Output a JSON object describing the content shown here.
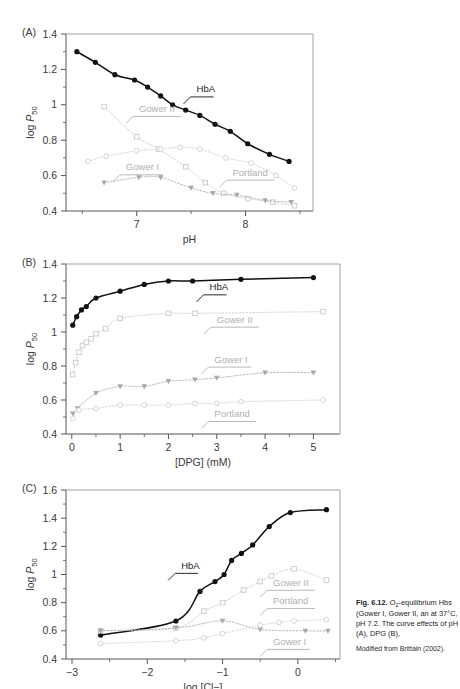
{
  "figure": {
    "number": "Fig. 6.12.",
    "caption_line1": "O",
    "caption_sub": "2",
    "caption_line1b": "-equilibrium",
    "caption_rest": "Hbs (Gower I, Gower II, an at 37°C, pH 7.2. The curve effects of pH (A), DPG (B),",
    "source": "Modified from Brittain (2002)."
  },
  "colors": {
    "hba": "#111111",
    "gower2": "#c9c9c9",
    "gower1": "#a8a8a8",
    "portland": "#cfcfcf",
    "axis": "#555555",
    "text": "#3a3a3a",
    "gray_label": "#b0b0b0"
  },
  "panels": [
    {
      "letter": "(A)",
      "name": "panel-a",
      "chart_data": {
        "type": "scatter",
        "title": "",
        "xlabel": "pH",
        "ylabel": "log P50",
        "xlim": [
          6.35,
          8.62
        ],
        "ylim": [
          0.4,
          1.4
        ],
        "xticks": [
          7,
          8
        ],
        "xminor": [
          6.5,
          7.5,
          8.5
        ],
        "yticks": [
          0.4,
          0.6,
          0.8,
          1.0,
          1.2,
          1.4
        ],
        "yminor": [
          0.5,
          0.7,
          0.9,
          1.1,
          1.3
        ],
        "grid": false,
        "series": [
          {
            "name": "HbA",
            "marker": "filled-circle",
            "color": "#111111",
            "x": [
              6.45,
              6.62,
              6.8,
              6.98,
              7.1,
              7.22,
              7.33,
              7.45,
              7.58,
              7.72,
              7.86,
              8.02,
              8.22,
              8.4
            ],
            "y": [
              1.3,
              1.24,
              1.17,
              1.14,
              1.1,
              1.05,
              1.0,
              0.97,
              0.94,
              0.89,
              0.85,
              0.78,
              0.72,
              0.68
            ]
          },
          {
            "name": "Gower II",
            "marker": "open-square",
            "color": "#c9c9c9",
            "x": [
              6.7,
              7.0,
              7.2,
              7.45,
              7.63,
              7.8,
              8.02,
              8.25,
              8.45
            ],
            "y": [
              0.99,
              0.82,
              0.75,
              0.65,
              0.56,
              0.5,
              0.47,
              0.45,
              0.43
            ]
          },
          {
            "name": "Gower I",
            "marker": "filled-triangle-down",
            "color": "#a8a8a8",
            "x": [
              6.7,
              7.02,
              7.22,
              7.5,
              7.7,
              7.92,
              8.18,
              8.42
            ],
            "y": [
              0.56,
              0.59,
              0.59,
              0.53,
              0.5,
              0.49,
              0.46,
              0.45
            ]
          },
          {
            "name": "Portland",
            "marker": "open-circle",
            "color": "#cfcfcf",
            "x": [
              6.55,
              6.72,
              7.0,
              7.22,
              7.4,
              7.58,
              7.82,
              8.05,
              8.28,
              8.45
            ],
            "y": [
              0.68,
              0.71,
              0.74,
              0.75,
              0.76,
              0.75,
              0.7,
              0.67,
              0.6,
              0.53
            ]
          }
        ],
        "annotations": [
          {
            "text": "HbA",
            "x": 7.55,
            "y": 1.07,
            "style": "dark"
          },
          {
            "text": "Gower II",
            "x": 7.02,
            "y": 0.96,
            "style": "gray"
          },
          {
            "text": "Gower I",
            "x": 6.9,
            "y": 0.63,
            "style": "gray"
          },
          {
            "text": "Portland",
            "x": 7.88,
            "y": 0.6,
            "style": "gray"
          }
        ]
      }
    },
    {
      "letter": "(B)",
      "name": "panel-b",
      "chart_data": {
        "type": "scatter",
        "title": "",
        "xlabel": "[DPG] (mM)",
        "ylabel": "log P50",
        "xlim": [
          -0.12,
          5.55
        ],
        "ylim": [
          0.4,
          1.4
        ],
        "xticks": [
          0,
          1,
          2,
          3,
          4,
          5
        ],
        "xminor": [
          0.5,
          1.5,
          2.5,
          3.5,
          4.5
        ],
        "yticks": [
          0.4,
          0.6,
          0.8,
          1.0,
          1.2,
          1.4
        ],
        "yminor": [
          0.5,
          0.7,
          0.9,
          1.1,
          1.3
        ],
        "grid": false,
        "series": [
          {
            "name": "HbA",
            "marker": "filled-circle",
            "color": "#111111",
            "x": [
              0.02,
              0.1,
              0.2,
              0.3,
              0.5,
              1.0,
              1.5,
              2.0,
              2.5,
              3.5,
              5.0
            ],
            "y": [
              1.04,
              1.09,
              1.13,
              1.15,
              1.2,
              1.24,
              1.28,
              1.3,
              1.3,
              1.31,
              1.32
            ]
          },
          {
            "name": "Gower II",
            "marker": "open-square",
            "color": "#c9c9c9",
            "x": [
              0.02,
              0.08,
              0.15,
              0.22,
              0.3,
              0.4,
              0.5,
              0.7,
              1.0,
              2.0,
              2.55,
              5.2
            ],
            "y": [
              0.75,
              0.82,
              0.88,
              0.92,
              0.94,
              0.96,
              0.99,
              1.02,
              1.08,
              1.11,
              1.11,
              1.12
            ]
          },
          {
            "name": "Gower I",
            "marker": "filled-triangle-down",
            "color": "#a8a8a8",
            "x": [
              0.02,
              0.12,
              0.5,
              1.0,
              1.5,
              2.0,
              2.55,
              3.0,
              4.0,
              5.0
            ],
            "y": [
              0.52,
              0.55,
              0.64,
              0.68,
              0.68,
              0.71,
              0.72,
              0.73,
              0.76,
              0.76
            ]
          },
          {
            "name": "Portland",
            "marker": "open-circle",
            "color": "#cfcfcf",
            "x": [
              0.02,
              0.15,
              0.5,
              1.0,
              1.5,
              2.0,
              2.55,
              3.0,
              3.5,
              5.2
            ],
            "y": [
              0.49,
              0.54,
              0.55,
              0.57,
              0.57,
              0.57,
              0.58,
              0.58,
              0.59,
              0.6
            ]
          }
        ],
        "annotations": [
          {
            "text": "HbA",
            "x": 2.85,
            "y": 1.245,
            "style": "dark"
          },
          {
            "text": "Gower II",
            "x": 3.0,
            "y": 1.055,
            "style": "gray"
          },
          {
            "text": "Gower I",
            "x": 2.95,
            "y": 0.82,
            "style": "gray"
          },
          {
            "text": "Portland",
            "x": 2.95,
            "y": 0.5,
            "style": "gray"
          }
        ]
      }
    },
    {
      "letter": "(C)",
      "name": "panel-c",
      "chart_data": {
        "type": "scatter",
        "title": "",
        "xlabel": "log [Cl−]",
        "ylabel": "log P50",
        "xlim": [
          -3.08,
          0.56
        ],
        "ylim": [
          0.4,
          1.6
        ],
        "xticks": [
          -3,
          -2,
          -1,
          0
        ],
        "xminor": [
          -2.5,
          -1.5,
          -0.5,
          0.5
        ],
        "yticks": [
          0.4,
          0.6,
          0.8,
          1.0,
          1.2,
          1.4,
          1.6
        ],
        "yminor": [
          0.5,
          0.7,
          0.9,
          1.1,
          1.3,
          1.5
        ],
        "grid": false,
        "series": [
          {
            "name": "HbA",
            "marker": "filled-circle",
            "color": "#111111",
            "x": [
              -2.62,
              -1.62,
              -1.3,
              -1.1,
              -0.98,
              -0.88,
              -0.75,
              -0.6,
              -0.38,
              -0.1,
              0.38
            ],
            "y": [
              0.57,
              0.67,
              0.88,
              0.95,
              1.0,
              1.1,
              1.15,
              1.21,
              1.34,
              1.44,
              1.46
            ]
          },
          {
            "name": "Gower II",
            "marker": "open-square",
            "color": "#c9c9c9",
            "x": [
              -2.62,
              -1.62,
              -1.25,
              -1.0,
              -0.72,
              -0.5,
              -0.35,
              -0.05,
              0.38
            ],
            "y": [
              0.6,
              0.62,
              0.74,
              0.8,
              0.89,
              0.95,
              0.99,
              1.04,
              0.96
            ]
          },
          {
            "name": "Gower I",
            "marker": "filled-triangle-down",
            "color": "#a8a8a8",
            "x": [
              -2.62,
              -1.62,
              -1.0,
              -0.5,
              0.1,
              0.4
            ],
            "y": [
              0.6,
              0.62,
              0.67,
              0.61,
              0.6,
              0.6
            ]
          },
          {
            "name": "Portland",
            "marker": "open-circle",
            "color": "#cfcfcf",
            "x": [
              -2.62,
              -1.62,
              -1.25,
              -1.0,
              -0.5,
              -0.25,
              -0.05,
              0.38
            ],
            "y": [
              0.51,
              0.53,
              0.55,
              0.58,
              0.64,
              0.66,
              0.67,
              0.68
            ]
          }
        ],
        "annotations": [
          {
            "text": "HbA",
            "x": -1.55,
            "y": 1.04,
            "style": "dark"
          },
          {
            "text": "Gower II",
            "x": -0.33,
            "y": 0.92,
            "style": "gray"
          },
          {
            "text": "Portland",
            "x": -0.33,
            "y": 0.79,
            "style": "gray"
          },
          {
            "text": "Gower I",
            "x": -0.33,
            "y": 0.5,
            "style": "gray"
          }
        ]
      }
    }
  ]
}
